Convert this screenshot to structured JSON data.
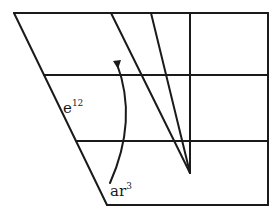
{
  "diagram": {
    "type": "geometric-construction",
    "stroke_color": "#1a1a1a",
    "background": "#ffffff",
    "labels": {
      "left_edge_label": {
        "base": "e",
        "superscript": "12"
      },
      "arrow_label": {
        "base": "ar",
        "superscript": "3"
      }
    },
    "shape": {
      "outline": "trapezoid with slanted left side",
      "horizontal_lines": 4,
      "vertical_lines": 2,
      "converging_diagonals": 2,
      "apex": "lower end of inner vertical line"
    },
    "arrow": {
      "direction": "upward",
      "from": "ar^3",
      "style": "curved"
    }
  }
}
